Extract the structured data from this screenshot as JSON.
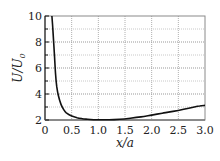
{
  "chart_data": {
    "type": "line",
    "title": "",
    "xlabel": "x/a",
    "ylabel": "U/U0",
    "xlim": [
      0,
      3.0
    ],
    "ylim": [
      2,
      10
    ],
    "xticks": [
      0,
      0.5,
      1.0,
      1.5,
      2.0,
      2.5,
      3.0
    ],
    "xtick_labels": [
      "0",
      "0.5",
      "1.0",
      "1.5",
      "2.0",
      "2.5",
      "3.0"
    ],
    "yticks": [
      2,
      4,
      6,
      8,
      10
    ],
    "ytick_labels": [
      "2",
      "4",
      "6",
      "8",
      "10"
    ],
    "grid": true,
    "grid_major_x": [
      0.5,
      1.0,
      1.5,
      2.0,
      2.5
    ],
    "grid_major_y": [
      4,
      6,
      8
    ],
    "grid_minor_y": [
      3,
      5,
      7,
      9
    ],
    "legend": null,
    "series": [
      {
        "name": "U/U0",
        "color": "#111111",
        "x": [
          0.13,
          0.15,
          0.18,
          0.2,
          0.22,
          0.25,
          0.3,
          0.35,
          0.4,
          0.5,
          0.6,
          0.7,
          0.8,
          1.0,
          1.2,
          1.4,
          1.6,
          1.8,
          2.0,
          2.2,
          2.4,
          2.6,
          2.8,
          2.9,
          3.0
        ],
        "values": [
          10.0,
          8.8,
          6.8,
          5.4,
          4.6,
          3.9,
          3.2,
          2.8,
          2.55,
          2.3,
          2.18,
          2.1,
          2.06,
          2.02,
          2.02,
          2.06,
          2.14,
          2.24,
          2.38,
          2.52,
          2.66,
          2.82,
          3.0,
          3.08,
          3.12
        ]
      }
    ]
  },
  "labels": {
    "xlabel": "x/a",
    "ylabel_main": "U/U",
    "ylabel_sub": "0"
  }
}
